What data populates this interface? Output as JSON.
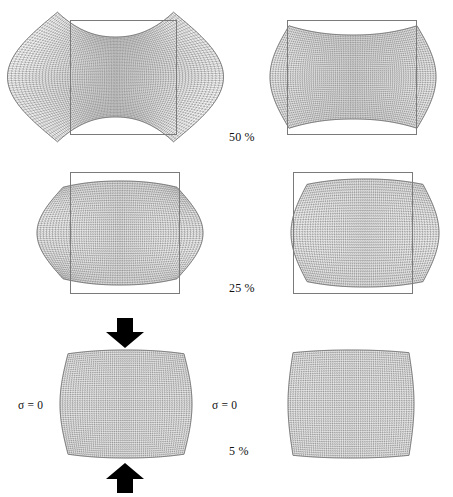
{
  "figure": {
    "background_color": "#ffffff",
    "width": 453,
    "height": 497,
    "mesh_line_color": "#4a4a4a",
    "reference_rect_color": "#7a7a7a",
    "arrow_color": "#000000",
    "columns": [
      {
        "id": "left",
        "name": "formulation-a"
      },
      {
        "id": "right",
        "name": "formulation-b"
      }
    ],
    "rows": [
      {
        "id": "row-50",
        "compression_label": "50 %",
        "compression_value": 50,
        "description": "Severe barrelling, mesh bulges far outside the reference outline"
      },
      {
        "id": "row-25",
        "compression_label": "25 %",
        "compression_value": 25,
        "description": "Moderate barrelling, mesh bulges past the vertical reference edges"
      },
      {
        "id": "row-5",
        "compression_label": "5 %",
        "compression_value": 5,
        "description": "Slight barrelling, near-original rectangular shape"
      }
    ]
  },
  "labels": {
    "pct_50": "50 %",
    "pct_25": "25 %",
    "pct_5": "5 %",
    "sigma_left": "σ = 0",
    "sigma_right": "σ = 0"
  },
  "annotations": {
    "load_arrow_top": "down-arrow",
    "load_arrow_bottom": "up-arrow",
    "boundary_condition": "σ = 0",
    "boundary_condition_sides": [
      "left",
      "right"
    ]
  },
  "chart_data": {
    "type": "diagram",
    "series": [
      {
        "name": "formulation-a",
        "compression_levels": [
          50,
          25,
          5
        ],
        "bulge_severity": [
          "extreme",
          "moderate",
          "slight"
        ]
      },
      {
        "name": "formulation-b",
        "compression_levels": [
          50,
          25,
          5
        ],
        "bulge_severity": [
          "moderate",
          "slight",
          "none"
        ]
      }
    ],
    "annotations": [
      "σ = 0",
      "σ = 0",
      "50 %",
      "25 %",
      "5 %"
    ]
  }
}
